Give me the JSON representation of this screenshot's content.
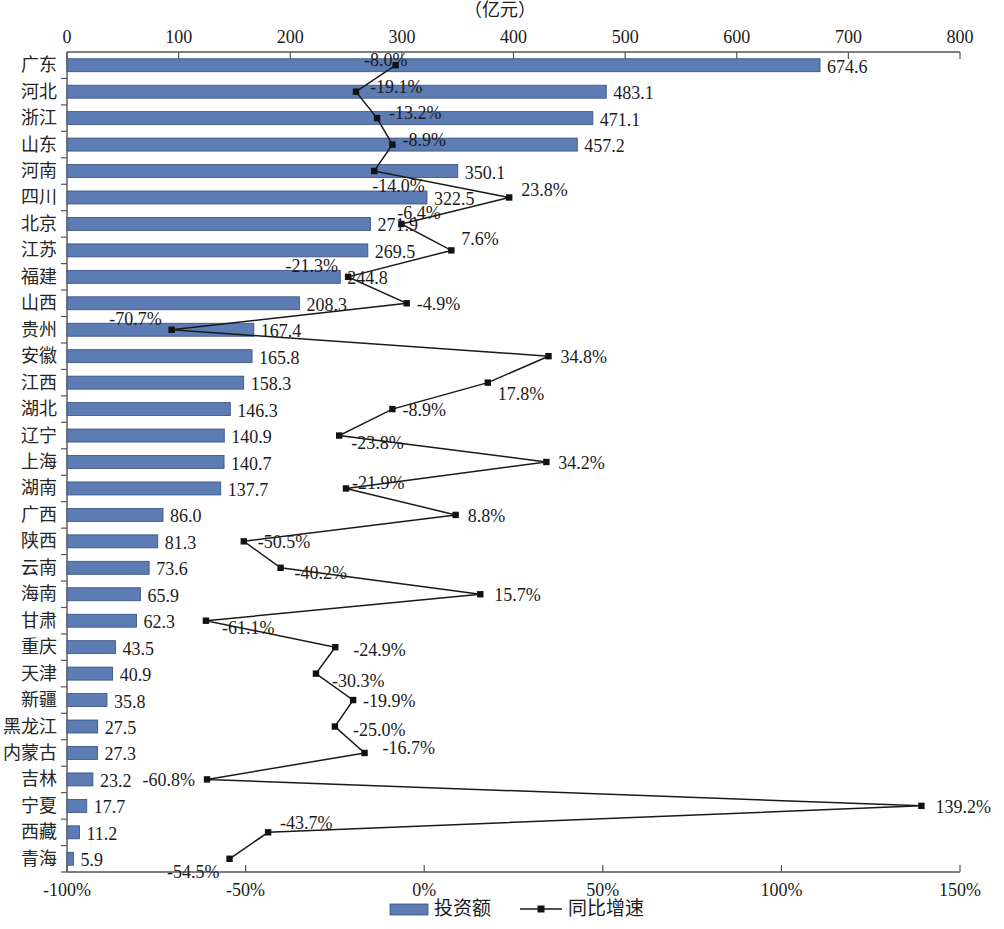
{
  "chart_data": {
    "type": "bar",
    "title": "",
    "unit_label": "（亿元）",
    "xlabel": "",
    "ylabel": "",
    "grid": false,
    "legend_position": "bottom",
    "orientation": "horizontal",
    "categories": [
      "广东",
      "河北",
      "浙江",
      "山东",
      "河南",
      "四川",
      "北京",
      "江苏",
      "福建",
      "山西",
      "贵州",
      "安徽",
      "江西",
      "湖北",
      "辽宁",
      "上海",
      "湖南",
      "广西",
      "陕西",
      "云南",
      "海南",
      "甘肃",
      "重庆",
      "天津",
      "新疆",
      "黑龙江",
      "内蒙古",
      "吉林",
      "宁夏",
      "西藏",
      "青海"
    ],
    "top_axis": {
      "name": "投资额",
      "unit": "（亿元）",
      "ticks": [
        "0",
        "100",
        "200",
        "300",
        "400",
        "500",
        "600",
        "700",
        "800"
      ],
      "tick_values": [
        0,
        100,
        200,
        300,
        400,
        500,
        600,
        700,
        800
      ],
      "lim": [
        0,
        800
      ]
    },
    "bottom_axis": {
      "name": "同比增速",
      "ticks": [
        "-100%",
        "-50%",
        "0%",
        "50%",
        "100%",
        "150%"
      ],
      "tick_values": [
        -100,
        -50,
        0,
        50,
        100,
        150
      ],
      "lim": [
        -100,
        150
      ]
    },
    "series": [
      {
        "name": "投资额",
        "type": "bar",
        "color": "#5c7cb3",
        "axis": "top",
        "values": [
          674.6,
          483.1,
          471.1,
          457.2,
          350.1,
          322.5,
          271.9,
          269.5,
          244.8,
          208.3,
          167.4,
          165.8,
          158.3,
          146.3,
          140.9,
          140.7,
          137.7,
          86.0,
          81.3,
          73.6,
          65.9,
          62.3,
          43.5,
          40.9,
          35.8,
          27.5,
          27.3,
          23.2,
          17.7,
          11.2,
          5.9
        ],
        "labels": [
          "674.6",
          "483.1",
          "471.1",
          "457.2",
          "350.1",
          "322.5",
          "271.9",
          "269.5",
          "244.8",
          "208.3",
          "167.4",
          "165.8",
          "158.3",
          "146.3",
          "140.9",
          "140.7",
          "137.7",
          "86.0",
          "81.3",
          "73.6",
          "65.9",
          "62.3",
          "43.5",
          "40.9",
          "35.8",
          "27.5",
          "27.3",
          "23.2",
          "17.7",
          "11.2",
          "5.9"
        ]
      },
      {
        "name": "同比增速",
        "type": "line",
        "color": "#1a1a1a",
        "axis": "bottom",
        "values": [
          -8.0,
          -19.1,
          -13.2,
          -8.9,
          -14.0,
          23.8,
          -6.4,
          7.6,
          -21.3,
          -4.9,
          -70.7,
          34.8,
          17.8,
          -8.9,
          -23.8,
          34.2,
          -21.9,
          8.8,
          -50.5,
          -40.2,
          15.7,
          -61.1,
          -24.9,
          -30.3,
          -19.9,
          -25.0,
          -16.7,
          -60.8,
          139.2,
          -43.7,
          -54.5
        ],
        "labels": [
          "-8.0%",
          "-19.1%",
          "-13.2%",
          "-8.9%",
          "-14.0%",
          "23.8%",
          "-6.4%",
          "7.6%",
          "-21.3%",
          "-4.9%",
          "-70.7%",
          "34.8%",
          "17.8%",
          "-8.9%",
          "-23.8%",
          "34.2%",
          "-21.9%",
          "8.8%",
          "-50.5%",
          "-40.2%",
          "15.7%",
          "-61.1%",
          "-24.9%",
          "-30.3%",
          "-19.9%",
          "-25.0%",
          "-16.7%",
          "-60.8%",
          "139.2%",
          "-43.7%",
          "-54.5%"
        ]
      }
    ]
  },
  "legend": {
    "items": [
      {
        "label": "投资额",
        "marker": "bar-swatch",
        "color": "#5c7cb3"
      },
      {
        "label": "同比增速",
        "marker": "line-marker",
        "color": "#1a1a1a"
      }
    ]
  }
}
